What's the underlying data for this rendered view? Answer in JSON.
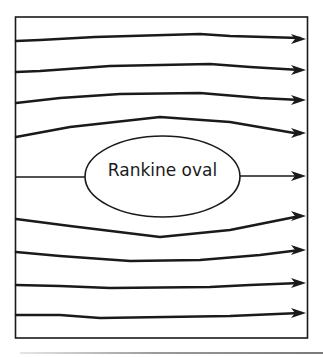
{
  "diagram": {
    "title": "Rankine oval",
    "oval_label": "Rankine oval",
    "stroke_color": "#1a1a1a",
    "background": "#ffffff",
    "streamlines": [
      {
        "id": "s1",
        "path": "M16 41 L40 40 L95 37 L200 34 L230 36 L300 38"
      },
      {
        "id": "s2",
        "path": "M16 72 L40 71 L110 66 L210 64 L250 67 L300 70"
      },
      {
        "id": "s3",
        "path": "M16 103 L60 98 L120 94 L200 93 L260 98 L300 100"
      },
      {
        "id": "s4",
        "path": "M16 137 L70 127 L160 117 L230 122 L300 134"
      },
      {
        "id": "s5-left",
        "path": "M16 177 L85 177"
      },
      {
        "id": "s5-right",
        "path": "M240 176 L300 176"
      },
      {
        "id": "s6",
        "path": "M16 219 L70 226 L160 237 L230 230 L300 216"
      },
      {
        "id": "s7",
        "path": "M16 252 L60 256 L130 261 L200 260 L260 255 L300 250"
      },
      {
        "id": "s8",
        "path": "M16 285 L60 286 L110 288 L210 287 L250 285 L300 283"
      },
      {
        "id": "s9",
        "path": "M16 315 L60 315 L100 318 L230 316 L300 313"
      }
    ],
    "arrow_tips_y": [
      39,
      70,
      100,
      133,
      176,
      216,
      250,
      283,
      313
    ]
  }
}
